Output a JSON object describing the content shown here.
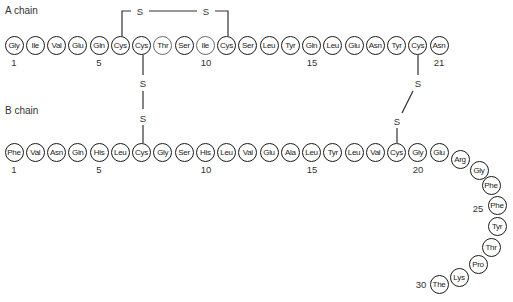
{
  "labels": {
    "a_chain": "A chain",
    "b_chain": "B chain",
    "sulfur": "S"
  },
  "a_chain": {
    "residues": [
      "Gly",
      "Ile",
      "Val",
      "Glu",
      "Gln",
      "Cys",
      "Cys",
      "Thr",
      "Ser",
      "Ile",
      "Cys",
      "Ser",
      "Leu",
      "Tyr",
      "Gln",
      "Leu",
      "Glu",
      "Asn",
      "Tyr",
      "Cys",
      "Asn"
    ],
    "position_labels": [
      {
        "index": 1,
        "text": "1"
      },
      {
        "index": 5,
        "text": "5"
      },
      {
        "index": 10,
        "text": "10"
      },
      {
        "index": 15,
        "text": "15"
      },
      {
        "index": 21,
        "text": "21"
      }
    ]
  },
  "b_chain": {
    "residues": [
      "Phe",
      "Val",
      "Asn",
      "Gln",
      "His",
      "Leu",
      "Cys",
      "Gly",
      "Ser",
      "His",
      "Leu",
      "Val",
      "Glu",
      "Ala",
      "Leu",
      "Tyr",
      "Leu",
      "Val",
      "Cys",
      "Gly",
      "Glu",
      "Arg",
      "Gly",
      "Phe",
      "Phe",
      "Tyr",
      "Thr",
      "Pro",
      "Lys",
      "The"
    ],
    "position_labels": [
      {
        "index": 1,
        "text": "1"
      },
      {
        "index": 5,
        "text": "5"
      },
      {
        "index": 10,
        "text": "10"
      },
      {
        "index": 15,
        "text": "15"
      },
      {
        "index": 20,
        "text": "20"
      },
      {
        "index": 25,
        "text": "25"
      },
      {
        "index": 30,
        "text": "30"
      }
    ]
  },
  "disulfide_bonds": [
    {
      "from": "A6",
      "to": "A11",
      "type": "intrachain"
    },
    {
      "from": "A7",
      "to": "B7",
      "type": "interchain"
    },
    {
      "from": "A20",
      "to": "B19",
      "type": "interchain"
    }
  ]
}
